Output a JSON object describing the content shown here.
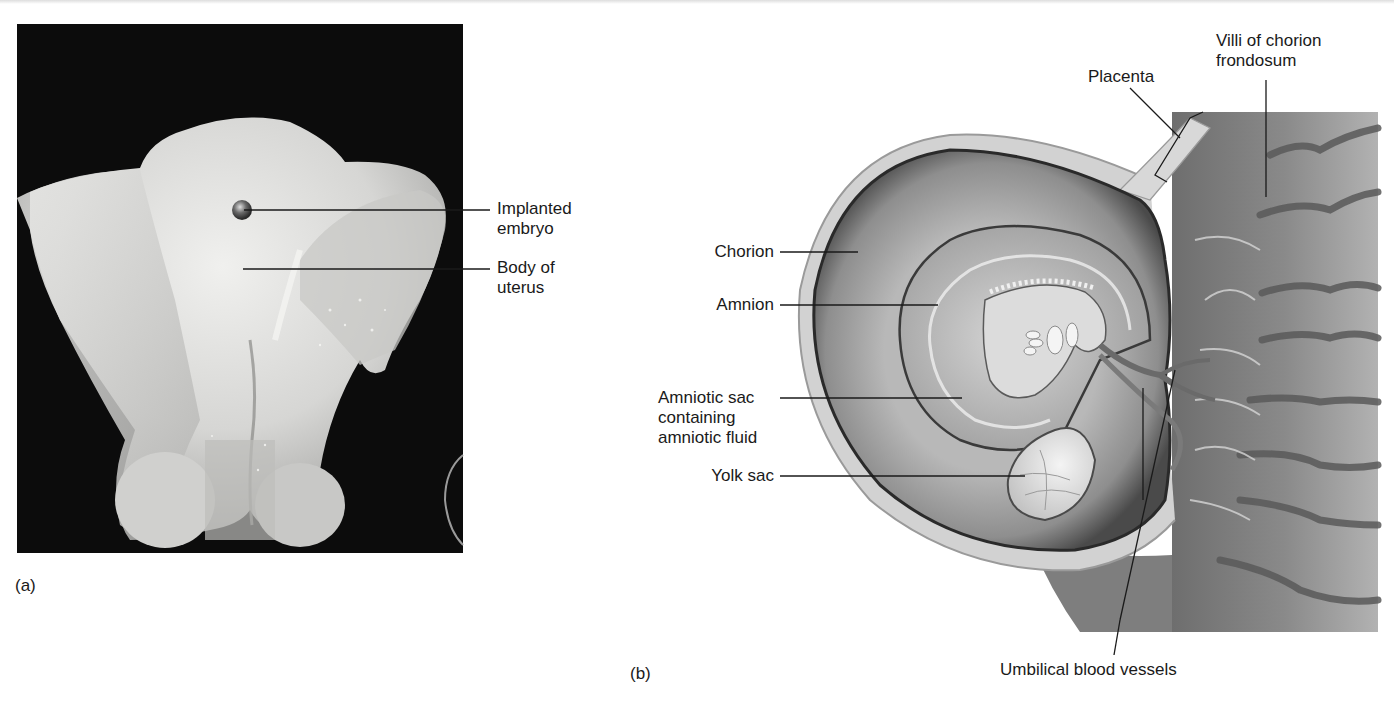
{
  "figure": {
    "panels": [
      {
        "id": "a",
        "tag": "(a)",
        "description": "Photograph of opened uterus with implanted embryo",
        "labels": [
          {
            "line1": "Implanted",
            "line2": "embryo"
          },
          {
            "line1": "Body of",
            "line2": "uterus"
          }
        ]
      },
      {
        "id": "b",
        "tag": "(b)",
        "description": "Illustration of embryo within amniotic sac and placenta",
        "labels": {
          "placenta": "Placenta",
          "villi": {
            "line1": "Villi of chorion",
            "line2": "frondosum"
          },
          "chorion": "Chorion",
          "amnion": "Amnion",
          "amniotic_sac": {
            "line1": "Amniotic sac",
            "line2": "containing",
            "line3": "amniotic fluid"
          },
          "yolk_sac": "Yolk sac",
          "umbilical": "Umbilical blood vessels"
        }
      }
    ],
    "colors": {
      "photo_background": "#0c0c0c",
      "tissue_light": "#d8d8d6",
      "leader_line": "#1a1a1a"
    }
  }
}
